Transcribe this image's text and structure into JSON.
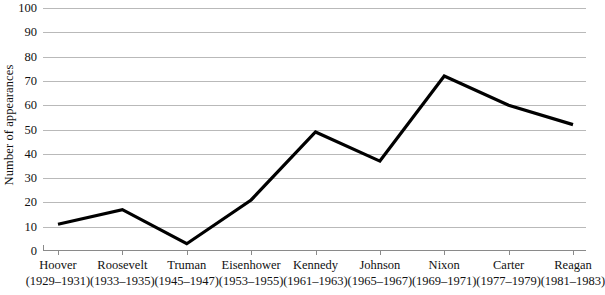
{
  "chart_data": {
    "type": "line",
    "title": "",
    "xlabel": "",
    "ylabel": "Number of appearances",
    "ylim": [
      0,
      100
    ],
    "ytick_step": 10,
    "yticks": [
      0,
      10,
      20,
      30,
      40,
      50,
      60,
      70,
      80,
      90,
      100
    ],
    "ytick_labels": [
      "0",
      "10",
      "20",
      "30",
      "40",
      "50",
      "60",
      "70",
      "80",
      "90",
      "100"
    ],
    "grid": true,
    "legend": false,
    "categories": [
      "Hoover",
      "Roosevelt",
      "Truman",
      "Eisenhower",
      "Kennedy",
      "Johnson",
      "Nixon",
      "Carter",
      "Reagan"
    ],
    "category_years": [
      "(1929–1931)",
      "(1933–1935)",
      "(1945–1947)",
      "(1953–1955)",
      "(1961–1963)",
      "(1965–1967)",
      "(1969–1971)",
      "(1977–1979)",
      "(1981–1983)"
    ],
    "values": [
      11,
      17,
      3,
      21,
      49,
      37,
      72,
      60,
      52
    ],
    "series": [
      {
        "name": "Number of appearances",
        "values": [
          11,
          17,
          3,
          21,
          49,
          37,
          72,
          60,
          52
        ],
        "color": "#000000",
        "line_width": 3.2
      }
    ],
    "colors": {
      "line": "#000000",
      "gridline": "#b9b9b9",
      "axis": "#8a8a8a",
      "text": "#111111",
      "background": "#ffffff"
    }
  }
}
